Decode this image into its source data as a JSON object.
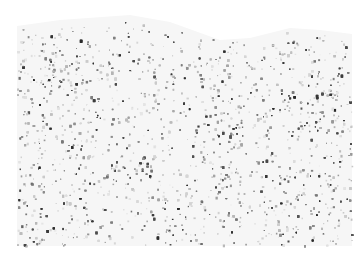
{
  "image": {
    "kind": "grayscale tissue section micrograph",
    "width": 364,
    "height": 266,
    "background_color": "#ffffff",
    "stain_color_dark": "#3a3a3a",
    "stain_color_light": "#d8d8d8",
    "tissue_region": {
      "left": 17,
      "right": 352,
      "bottom": 246,
      "top_edge_points": [
        [
          17,
          26
        ],
        [
          60,
          20
        ],
        [
          130,
          15
        ],
        [
          170,
          22
        ],
        [
          220,
          40
        ],
        [
          250,
          38
        ],
        [
          290,
          28
        ],
        [
          320,
          30
        ],
        [
          352,
          34
        ]
      ]
    },
    "density_hotspots": [
      {
        "x": 40,
        "y": 70,
        "r": 45,
        "weight": 1.6
      },
      {
        "x": 320,
        "y": 95,
        "r": 50,
        "weight": 1.5
      },
      {
        "x": 290,
        "y": 200,
        "r": 55,
        "weight": 1.3
      },
      {
        "x": 60,
        "y": 225,
        "r": 40,
        "weight": 1.3
      },
      {
        "x": 110,
        "y": 50,
        "r": 35,
        "weight": 1.2
      }
    ],
    "dot_count": 5200,
    "faint_bottom_mark": ""
  }
}
